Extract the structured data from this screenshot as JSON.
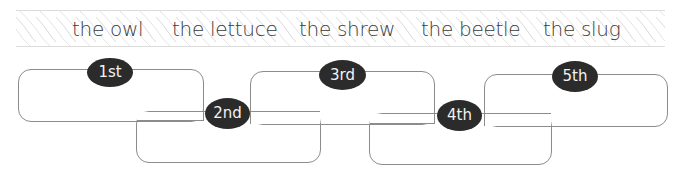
{
  "word_bank": {
    "words": [
      "the owl",
      "the lettuce",
      "the shrew",
      "the beetle",
      "the slug"
    ]
  },
  "order_boxes": [
    {
      "label": "1st",
      "value": ""
    },
    {
      "label": "2nd",
      "value": ""
    },
    {
      "label": "3rd",
      "value": ""
    },
    {
      "label": "4th",
      "value": ""
    },
    {
      "label": "5th",
      "value": ""
    }
  ],
  "colors": {
    "oval_fill": "#2b2b2b",
    "oval_text": "#f2f2f2",
    "box_border": "#8c8c8c",
    "word_text": "#3a3a3a",
    "banner_hatch": "#d8d8d8"
  }
}
